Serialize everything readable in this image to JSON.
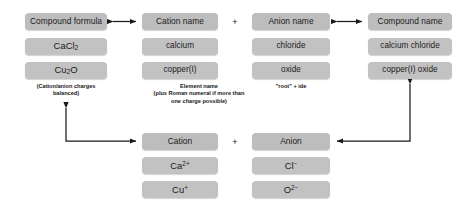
{
  "diagram": {
    "box_color": "#c2c2c2",
    "header_color": "#bdbdbd",
    "arrow_color": "#1a1a1a",
    "background": "#ffffff"
  },
  "top_row": {
    "columns": [
      {
        "id": "compound-formula",
        "header": "Compound formula",
        "examples": [
          "CaCl2",
          "Cu2O"
        ],
        "example_html": [
          "CaCl<sub>2</sub>",
          "Cu<sub>2</sub>O"
        ],
        "caption": "(Cation/anion charges\nbalanced)"
      },
      {
        "id": "cation-name",
        "header": "Cation name",
        "examples": [
          "calcium",
          "copper(I)"
        ],
        "example_html": [
          "calcium",
          "copper(I)"
        ],
        "caption": "Element name\n(plus Roman numeral if more than\none charge possible)"
      },
      {
        "id": "anion-name",
        "header": "Anion name",
        "examples": [
          "chloride",
          "oxide"
        ],
        "example_html": [
          "chloride",
          "oxide"
        ],
        "caption": "\"root\" + ide"
      },
      {
        "id": "compound-name",
        "header": "Compound name",
        "examples": [
          "calcium chloride",
          "copper(I) oxide"
        ],
        "example_html": [
          "calcium chloride",
          "copper(I) oxide"
        ],
        "caption": ""
      }
    ],
    "operators": {
      "plus": "+"
    }
  },
  "bottom_row": {
    "columns": [
      {
        "id": "cation",
        "header": "Cation",
        "examples": [
          "Ca2+",
          "Cu+"
        ],
        "example_html": [
          "Ca<sup>2+</sup>",
          "Cu<sup>+</sup>"
        ]
      },
      {
        "id": "anion",
        "header": "Anion",
        "examples": [
          "Cl-",
          "O2-"
        ],
        "example_html": [
          "Cl<sup>&#8722;</sup>",
          "O<sup>2&#8722;</sup>"
        ]
      }
    ],
    "operators": {
      "plus": "+"
    }
  },
  "connectors": [
    {
      "id": "formula-to-cation-name",
      "type": "double-arrow"
    },
    {
      "id": "anion-name-to-compound-name",
      "type": "double-arrow"
    },
    {
      "id": "cation-to-formula",
      "type": "elbow-arrow-up-left"
    },
    {
      "id": "compound-name-to-anion",
      "type": "elbow-arrow-down-left"
    }
  ]
}
